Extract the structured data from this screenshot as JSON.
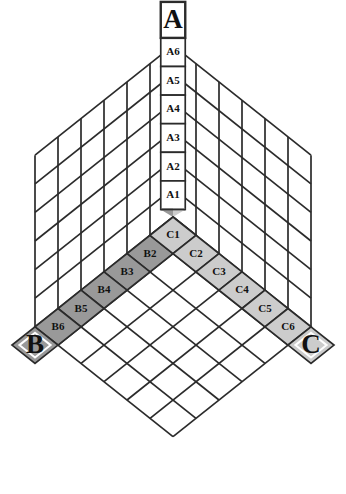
{
  "figure": {
    "background_color": "#ffffff",
    "line_color": "#2b2b2b",
    "text_color": "#111111"
  },
  "vertices": {
    "top": {
      "id": "A",
      "label": "A",
      "fill": "#ffffff"
    },
    "bottom_left": {
      "id": "B",
      "label": "B",
      "fill": "#999999"
    },
    "bottom_right": {
      "id": "C",
      "label": "C",
      "fill": "#cccccc"
    }
  },
  "columns": {
    "a_axis": {
      "name": "A",
      "orientation": "vertical",
      "fill": "#ffffff",
      "cells": [
        {
          "label": "A6"
        },
        {
          "label": "A5"
        },
        {
          "label": "A4"
        },
        {
          "label": "A3"
        },
        {
          "label": "A2"
        },
        {
          "label": "A1"
        }
      ]
    },
    "b_axis": {
      "name": "B",
      "orientation": "diagonal-down-left",
      "fill": "#999999",
      "cells": [
        {
          "label": "B1"
        },
        {
          "label": "B2"
        },
        {
          "label": "B3"
        },
        {
          "label": "B4"
        },
        {
          "label": "B5"
        },
        {
          "label": "B6"
        }
      ]
    },
    "c_axis": {
      "name": "C",
      "orientation": "diagonal-down-right",
      "fill": "#cccccc",
      "cells": [
        {
          "label": "C1"
        },
        {
          "label": "C2"
        },
        {
          "label": "C3"
        },
        {
          "label": "C4"
        },
        {
          "label": "C5"
        },
        {
          "label": "C6"
        }
      ]
    }
  },
  "panels": {
    "left_wall": {
      "name": "left-wall",
      "rows": 6,
      "cols": 6,
      "fill": "#ffffff"
    },
    "right_wall": {
      "name": "right-wall",
      "rows": 6,
      "cols": 6,
      "fill": "#ffffff"
    },
    "floor": {
      "name": "floor-lattice",
      "rows": 6,
      "cols": 6,
      "fill": "#ffffff"
    }
  }
}
